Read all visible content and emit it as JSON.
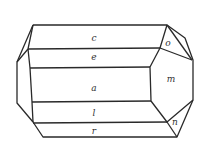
{
  "diagram": {
    "title": "",
    "type": "crystal-habit",
    "faces": [
      {
        "id": "c",
        "label": "c",
        "x": 94,
        "y": 41
      },
      {
        "id": "e",
        "label": "e",
        "x": 94,
        "y": 60
      },
      {
        "id": "a",
        "label": "a",
        "x": 94,
        "y": 91
      },
      {
        "id": "l",
        "label": "l",
        "x": 94,
        "y": 116
      },
      {
        "id": "r",
        "label": "r",
        "x": 94,
        "y": 134
      },
      {
        "id": "o",
        "label": "o",
        "x": 168,
        "y": 46
      },
      {
        "id": "m",
        "label": "m",
        "x": 171,
        "y": 82
      },
      {
        "id": "n",
        "label": "n",
        "x": 175,
        "y": 125
      }
    ],
    "colors": {
      "stroke": "#2a2a2a",
      "label": "#333333",
      "background": "#ffffff"
    }
  }
}
